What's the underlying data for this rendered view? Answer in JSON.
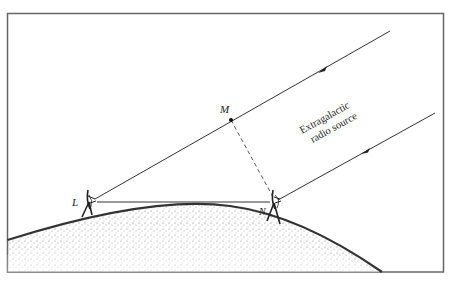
{
  "figure": {
    "labels": {
      "point_m": "M",
      "point_l": "L",
      "point_n": "N",
      "source_line1": "Extragalactic",
      "source_line2": "radio source"
    },
    "colors": {
      "line": "#333333",
      "frame": "#666666",
      "earth_stipple": "#888888",
      "background": "#ffffff"
    },
    "elements": {
      "frame": "rectangular border",
      "ray_upper": "incoming ray to telescope L passing through M",
      "ray_lower": "incoming ray to telescope N",
      "baseline": "line L to N",
      "delay_path": "dashed line M to N",
      "earth_surface": "stippled arc",
      "telescope_l": "dish antenna at L",
      "telescope_n": "dish antenna at N"
    }
  }
}
